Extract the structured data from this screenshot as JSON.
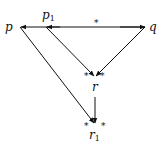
{
  "diagram": {
    "type": "commutative-diagram",
    "nodes": {
      "p": {
        "label": "p",
        "x": 20,
        "y": 27
      },
      "p1": {
        "label": "p",
        "sub": "1",
        "x": 46,
        "y": 27
      },
      "q": {
        "label": "q",
        "x": 145,
        "y": 27
      },
      "r": {
        "label": "r",
        "x": 95,
        "y": 77
      },
      "r1": {
        "label": "r",
        "sub": "1",
        "x": 95,
        "y": 124
      }
    },
    "edges": [
      {
        "from": "q",
        "to": "p",
        "label": "*",
        "arrow": "to-p"
      },
      {
        "from": "q",
        "to": "p1",
        "arrow": "to-p1"
      },
      {
        "from": "p1",
        "to": "r",
        "arrow": "to-r"
      },
      {
        "from": "q",
        "to": "r",
        "arrow": "to-r"
      },
      {
        "from": "p",
        "to": "r1",
        "arrow": "to-r1"
      },
      {
        "from": "r",
        "to": "r1",
        "arrow": "to-r1"
      }
    ],
    "star_marks": {
      "top_edge": "*",
      "r_left": "*",
      "r_right": "*",
      "r1_left": "*",
      "r1_right": "*"
    },
    "colors": {
      "ink": "#111111",
      "background": "#ffffff"
    }
  }
}
